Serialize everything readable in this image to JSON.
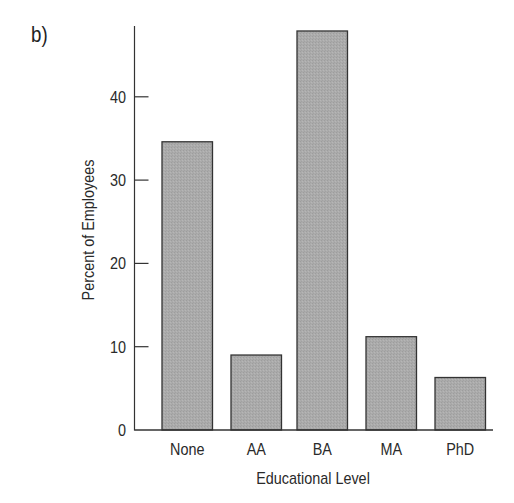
{
  "panel_label": "b)",
  "colors": {
    "bar_fill": "#ababab",
    "bar_stroke": "#333333",
    "axis": "#333333",
    "text": "#2a2a2a"
  },
  "chart_data": {
    "type": "bar",
    "title": "",
    "panel": "b)",
    "categories": [
      "None",
      "AA",
      "BA",
      "MA",
      "PhD"
    ],
    "values": [
      34.6,
      9.0,
      47.9,
      11.2,
      6.3
    ],
    "xlabel": "Educational Level",
    "ylabel": "Percent of Employees",
    "ylim": [
      0,
      48
    ],
    "yticks": [
      0,
      10,
      20,
      30,
      40
    ],
    "ytick_labels": [
      "0",
      "10",
      "20",
      "30",
      "40"
    ],
    "grid": false,
    "legend": null
  }
}
